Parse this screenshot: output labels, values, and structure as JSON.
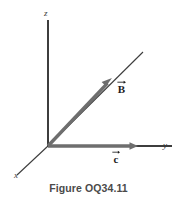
{
  "figure": {
    "caption": "Figure OQ34.11",
    "top_bleed_text": "∙  ∙∙  ∙  ∙",
    "background_color": "#ffffff"
  },
  "axes": {
    "origin": {
      "x": 48,
      "y": 146
    },
    "items": [
      {
        "name": "z-axis",
        "label": "z",
        "direction": "up",
        "line_color": "#3d3d3d",
        "end": {
          "x": 48,
          "y": 20
        }
      },
      {
        "name": "y-axis",
        "label": "y",
        "direction": "right",
        "line_color": "#3d3d3d",
        "end": {
          "x": 172,
          "y": 146
        }
      },
      {
        "name": "x-axis",
        "label": "x",
        "direction": "down-left",
        "line_color": "#3d3d3d",
        "end": {
          "x": 17,
          "y": 175
        }
      },
      {
        "name": "b-guide-axis",
        "label": "",
        "direction": "up-right",
        "line_color": "#3d3d3d",
        "end": {
          "x": 143,
          "y": 52
        }
      }
    ]
  },
  "vectors": [
    {
      "name": "vector-b",
      "label": "B",
      "has_overarrow": true,
      "color": "#6e6e6e",
      "tail": {
        "x": 48,
        "y": 146
      },
      "tip": {
        "x": 112,
        "y": 78
      }
    },
    {
      "name": "vector-c",
      "label": "c",
      "has_overarrow": true,
      "color": "#6e6e6e",
      "tail": {
        "x": 48,
        "y": 146
      },
      "tip": {
        "x": 138,
        "y": 146
      }
    }
  ]
}
